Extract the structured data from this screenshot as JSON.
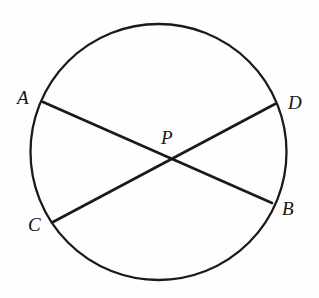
{
  "figure": {
    "background_color": "#fefefe",
    "stroke_color": "#1a1a1a",
    "width": 319,
    "height": 298
  },
  "circle": {
    "name": "circle",
    "center_x": 158.5,
    "center_y": 152,
    "radius": 128,
    "stroke_width": 2.3
  },
  "points": {
    "A": {
      "label": "A",
      "x": 43,
      "y": 102,
      "label_x": 17,
      "label_y": 88
    },
    "B": {
      "label": "B",
      "x": 272,
      "y": 203,
      "label_x": 282,
      "label_y": 199
    },
    "C": {
      "label": "C",
      "x": 53,
      "y": 222,
      "label_x": 28,
      "label_y": 215
    },
    "D": {
      "label": "D",
      "x": 275,
      "y": 104,
      "label_x": 288,
      "label_y": 93
    },
    "P": {
      "label": "P",
      "x": 170,
      "y": 162,
      "label_x": 161,
      "label_y": 128
    }
  },
  "chords": [
    {
      "name": "chord-AB",
      "from": "A",
      "to": "B",
      "stroke_width": 2.6
    },
    {
      "name": "chord-CD",
      "from": "C",
      "to": "D",
      "stroke_width": 2.6
    }
  ]
}
